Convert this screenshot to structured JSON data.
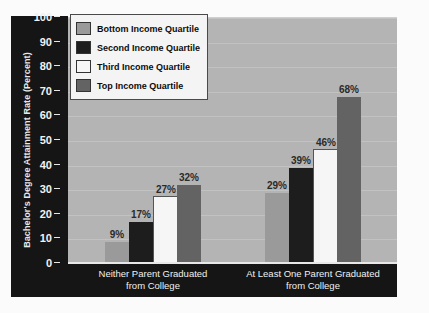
{
  "chart_data": {
    "type": "bar",
    "title": "",
    "subtitle": "",
    "xlabel": "",
    "ylabel": "Bachelor's Degree Attainment Rate (Percent)",
    "ylim": [
      0,
      100
    ],
    "ytick_step": 10,
    "yticks": [
      "100",
      "90",
      "80",
      "70",
      "60",
      "50",
      "40",
      "30",
      "20",
      "10",
      "0"
    ],
    "grid": true,
    "grid_axis": "y",
    "legend_position": "top-left",
    "categories": [
      "Neither Parent Graduated from College",
      "At Least One Parent Graduated from College"
    ],
    "category_lines": [
      [
        "Neither Parent Graduated",
        "from College"
      ],
      [
        "At Least One Parent Graduated",
        "from College"
      ]
    ],
    "series": [
      {
        "name": "Bottom Income Quartile",
        "color": "#9a9a9a",
        "values": [
          9,
          29
        ],
        "labels": [
          "9%",
          "29%"
        ]
      },
      {
        "name": "Second Income Quartile",
        "color": "#1d1d1d",
        "values": [
          17,
          39
        ],
        "labels": [
          "17%",
          "39%"
        ]
      },
      {
        "name": "Third Income Quartile",
        "color": "#f6f6f6",
        "values": [
          27,
          46
        ],
        "labels": [
          "27%",
          "46%"
        ]
      },
      {
        "name": "Top Income Quartile",
        "color": "#636363",
        "values": [
          32,
          68
        ],
        "labels": [
          "32%",
          "68%"
        ]
      }
    ],
    "colors": {
      "plot_background": "#b4b4b4",
      "axis_band": "#151515",
      "gridline": "#c2c2c2",
      "figure_background": "#fbfbfb",
      "label_text": "#2a2a2a",
      "axis_text": "#f2f2f2"
    }
  }
}
